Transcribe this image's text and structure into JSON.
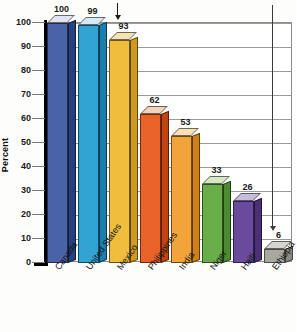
{
  "chart_data": {
    "type": "bar",
    "title": "",
    "xlabel": "",
    "ylabel": "Percent",
    "ylim": [
      0,
      100
    ],
    "ytick_step": 10,
    "grid": true,
    "legend": "none",
    "style": "3d-bar",
    "categories": [
      "Canada",
      "United States",
      "Mexico",
      "Philippines",
      "India",
      "Niger",
      "Haiti",
      "Ethiopia"
    ],
    "values": [
      100,
      99,
      93,
      62,
      53,
      33,
      26,
      6
    ],
    "value_labels": [
      "100",
      "99",
      "93",
      "62",
      "53",
      "33",
      "26",
      "6"
    ],
    "ytick_labels": [
      "100",
      "90",
      "80",
      "70",
      "60",
      "50",
      "40",
      "30",
      "20",
      "10",
      "0"
    ],
    "bar_colors": [
      "#4a62a8",
      "#31a4d4",
      "#f0bd3c",
      "#e8622a",
      "#f2a43a",
      "#6aae4a",
      "#6a4a9c",
      "#a8a8a0"
    ],
    "bar_top_colors": [
      "#dfe6f2",
      "#d6eaf6",
      "#f4e3b0",
      "#f3d3ba",
      "#f7e2b8",
      "#d5e8c6",
      "#c8bcdd",
      "#d5d5cf"
    ],
    "bar_side_colors": [
      "#27417f",
      "#1b7fae",
      "#cf9a1e",
      "#c44313",
      "#cf8017",
      "#4a8a31",
      "#4b3077",
      "#8a8a82"
    ],
    "annotations": [
      {
        "name": "arrow-united-states",
        "target": "United States",
        "direction": "down"
      },
      {
        "name": "arrow-ethiopia",
        "target": "Ethiopia",
        "direction": "down"
      }
    ]
  },
  "axis": {
    "y_title": "Percent"
  }
}
